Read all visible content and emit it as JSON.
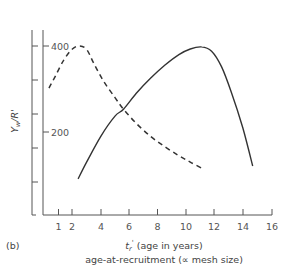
{
  "chart_data": {
    "type": "line",
    "panel_label": "(b)",
    "title": "",
    "xlabel": "t_r' (age in years)",
    "xlabel_line2": "age-at-recruitment (∝ mesh size)",
    "xlabel_symbol": "t",
    "xlabel_subscript": "r",
    "xlabel_prime": "'",
    "xlabel_rest": " (age in years)",
    "ylabel": "Y_w/R'",
    "ylabel_symbol": "Y",
    "ylabel_subscript": "w",
    "ylabel_rest": "/R'",
    "xlim": [
      0,
      16
    ],
    "ylim": [
      0,
      430
    ],
    "x_ticks": [
      1,
      2,
      4,
      6,
      8,
      10,
      12,
      14,
      16
    ],
    "y_ticks_labeled": [
      200,
      400
    ],
    "outer_axis_ticks": 5,
    "grid": false,
    "legend": null,
    "series": [
      {
        "name": "dashed-curve",
        "style": "dashed",
        "x": [
          0.35,
          0.8,
          1.4,
          2.0,
          2.5,
          3.0,
          3.5,
          4.2,
          5.0,
          5.6,
          6.5,
          7.5,
          8.5,
          9.5,
          10.3,
          11.1
        ],
        "y": [
          302,
          330,
          368,
          393,
          400,
          392,
          360,
          318,
          280,
          253,
          220,
          190,
          166,
          145,
          130,
          116
        ]
      },
      {
        "name": "solid-curve",
        "style": "solid",
        "x": [
          2.4,
          3.0,
          4.0,
          5.0,
          5.6,
          6.5,
          7.5,
          8.5,
          9.5,
          10.3,
          11.1,
          11.8,
          12.5,
          13.2,
          14.0,
          14.7
        ],
        "y": [
          91,
          130,
          190,
          237,
          253,
          290,
          325,
          355,
          380,
          393,
          398,
          388,
          352,
          292,
          210,
          121
        ]
      }
    ]
  },
  "labels": {
    "y_tick_400": "400",
    "y_tick_200": "200",
    "x_tick_1": "1",
    "x_tick_2": "2",
    "x_tick_4": "4",
    "x_tick_6": "6",
    "x_tick_8": "8",
    "x_tick_10": "10",
    "x_tick_12": "12",
    "x_tick_14": "14",
    "x_tick_16": "16"
  }
}
